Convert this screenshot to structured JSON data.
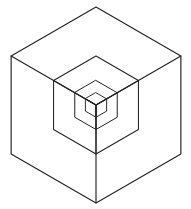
{
  "figure": {
    "type": "geometric-line-drawing",
    "background_color": "#ffffff",
    "stroke_color": "#232323",
    "stroke_width": 1.05,
    "canvas": {
      "width": 191,
      "height": 209
    },
    "center": {
      "x": 96,
      "y": 105
    },
    "outer_radius": 98,
    "recursion_levels": 4,
    "scale_factor": 0.5,
    "chart_data": {
      "type": "scatter",
      "title": "Recursive isometric cube hexagon",
      "xlabel": "",
      "ylabel": "",
      "grid": false,
      "legend": "none",
      "xlim": [
        0,
        191
      ],
      "ylim": [
        0,
        209
      ],
      "levels": [
        {
          "level": 0,
          "radius": 98,
          "hexagon_vertices": [
            {
              "x": 96,
              "y": 7
            },
            {
              "x": 181,
              "y": 56
            },
            {
              "x": 181,
              "y": 154
            },
            {
              "x": 96,
              "y": 203
            },
            {
              "x": 11,
              "y": 154
            },
            {
              "x": 11,
              "y": 56
            }
          ],
          "spokes": [
            {
              "x": 181,
              "y": 56
            },
            {
              "x": 181,
              "y": 154
            },
            {
              "x": 11,
              "y": 154
            },
            {
              "x": 11,
              "y": 56
            }
          ]
        },
        {
          "level": 1,
          "radius": 49,
          "hexagon_vertices": [
            {
              "x": 96,
              "y": 56
            },
            {
              "x": 138,
              "y": 80.5
            },
            {
              "x": 138,
              "y": 129.5
            },
            {
              "x": 96,
              "y": 154
            },
            {
              "x": 53,
              "y": 129.5
            },
            {
              "x": 53,
              "y": 80.5
            }
          ]
        },
        {
          "level": 2,
          "radius": 24.5,
          "hexagon_vertices": [
            {
              "x": 96,
              "y": 80.5
            },
            {
              "x": 117,
              "y": 92.75
            },
            {
              "x": 117,
              "y": 117.25
            },
            {
              "x": 96,
              "y": 129.5
            },
            {
              "x": 74.8,
              "y": 117.25
            },
            {
              "x": 74.8,
              "y": 92.75
            }
          ]
        },
        {
          "level": 3,
          "radius": 12.25,
          "hexagon_vertices": [
            {
              "x": 96,
              "y": 92.75
            },
            {
              "x": 106.6,
              "y": 98.9
            },
            {
              "x": 106.6,
              "y": 111.1
            },
            {
              "x": 96,
              "y": 117.25
            },
            {
              "x": 85.4,
              "y": 111.1
            },
            {
              "x": 85.4,
              "y": 98.9
            }
          ]
        }
      ]
    }
  }
}
